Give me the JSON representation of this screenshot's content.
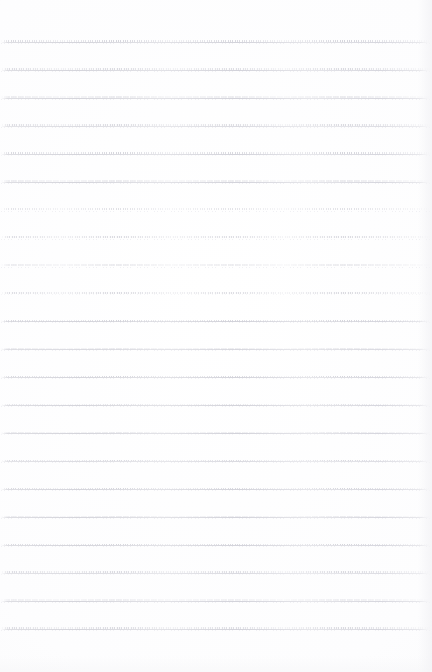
{
  "page": {
    "kind": "scanned-ruled-paper",
    "width": 432,
    "height": 672,
    "background_color": "#fefeff",
    "has_visible_text": false,
    "text_content": "",
    "description_label": ""
  },
  "rules": {
    "count": 22,
    "first_line_y": 42,
    "line_spacing": 27.95,
    "left_x": 1,
    "right_x": 430,
    "stroke_color": "#d6d6dc",
    "tick_color": "#cecdd6",
    "style": "dotted-hairline",
    "positions_y": [
      42.0,
      69.95,
      97.9,
      125.85,
      153.8,
      181.75,
      209.7,
      237.65,
      265.6,
      293.55,
      321.5,
      349.45,
      377.4,
      405.35,
      433.3,
      461.25,
      489.2,
      517.15,
      545.1,
      573.05,
      601.0,
      628.95
    ]
  },
  "margins": {
    "top": 42,
    "bottom": 43,
    "left": 1,
    "right": 2
  }
}
